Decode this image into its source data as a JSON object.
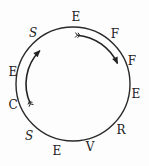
{
  "diagram": {
    "type": "circular letter ring",
    "circle": {
      "cx": 73,
      "cy": 84,
      "r": 57,
      "stroke": "#2a2a2a"
    },
    "letters": [
      {
        "char": "E",
        "x": 76,
        "y": 21,
        "italic": false
      },
      {
        "char": "F",
        "x": 115,
        "y": 38,
        "italic": false
      },
      {
        "char": "F",
        "x": 132,
        "y": 65,
        "italic": false
      },
      {
        "char": "E",
        "x": 136,
        "y": 98,
        "italic": false
      },
      {
        "char": "R",
        "x": 121,
        "y": 134,
        "italic": false
      },
      {
        "char": "V",
        "x": 90,
        "y": 151,
        "italic": false
      },
      {
        "char": "E",
        "x": 57,
        "y": 155,
        "italic": false
      },
      {
        "char": "S",
        "x": 29,
        "y": 140,
        "italic": true
      },
      {
        "char": "C",
        "x": 13,
        "y": 109,
        "italic": false
      },
      {
        "char": "E",
        "x": 13,
        "y": 76,
        "italic": false
      },
      {
        "char": "S",
        "x": 33,
        "y": 37,
        "italic": true
      }
    ],
    "arrows": [
      {
        "name": "clockwise-arrow-top-right",
        "direction": "clockwise",
        "from_deg": -85,
        "to_deg": -25,
        "r": 49
      },
      {
        "name": "upward-arrow-left",
        "direction": "clockwise",
        "from_deg": 155,
        "to_deg": 225,
        "r": 47
      }
    ]
  }
}
